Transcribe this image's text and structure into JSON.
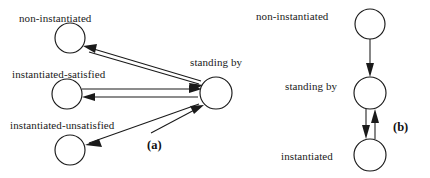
{
  "figure": {
    "type": "state-transition-diagram",
    "panels": [
      {
        "id": "a",
        "caption": "(a)",
        "nodes": [
          {
            "id": "a-non-instantiated",
            "label": "non-instantiated",
            "cx": 70,
            "cy": 38,
            "r": 15
          },
          {
            "id": "a-instantiated-satisfied",
            "label": "instantiated-satisfied",
            "cx": 67,
            "cy": 94,
            "r": 15
          },
          {
            "id": "a-instantiated-unsatisfied",
            "label": "instantiated-unsatisfied",
            "cx": 70,
            "cy": 150,
            "r": 15
          },
          {
            "id": "a-standing-by",
            "label": "standing by",
            "cx": 216,
            "cy": 93,
            "r": 16
          }
        ],
        "edges": [
          {
            "from": "a-standing-by",
            "to": "a-non-instantiated",
            "direction": "bidirectional"
          },
          {
            "from": "a-standing-by",
            "to": "a-instantiated-satisfied",
            "direction": "bidirectional"
          },
          {
            "from": "a-standing-by",
            "to": "a-instantiated-unsatisfied",
            "direction": "bidirectional"
          }
        ]
      },
      {
        "id": "b",
        "caption": "(b)",
        "nodes": [
          {
            "id": "b-non-instantiated",
            "label": "non-instantiated",
            "cx": 370,
            "cy": 24,
            "r": 15
          },
          {
            "id": "b-standing-by",
            "label": "standing by",
            "cx": 370,
            "cy": 93,
            "r": 16
          },
          {
            "id": "b-instantiated",
            "label": "instantiated",
            "cx": 370,
            "cy": 155,
            "r": 16
          }
        ],
        "edges": [
          {
            "from": "b-non-instantiated",
            "to": "b-standing-by",
            "direction": "down"
          },
          {
            "from": "b-standing-by",
            "to": "b-instantiated",
            "direction": "bidirectional"
          }
        ]
      }
    ],
    "colors": {
      "ink": "#1a1a1a",
      "background": "#ffffff"
    }
  },
  "labels": {
    "a_non_instantiated": "non-instantiated",
    "a_instantiated_satisfied": "instantiated-satisfied",
    "a_instantiated_unsatisfied": "instantiated-unsatisfied",
    "a_standing_by": "standing by",
    "a_caption": "(a)",
    "b_non_instantiated": "non-instantiated",
    "b_standing_by": "standing by",
    "b_instantiated": "instantiated",
    "b_caption": "(b)"
  }
}
